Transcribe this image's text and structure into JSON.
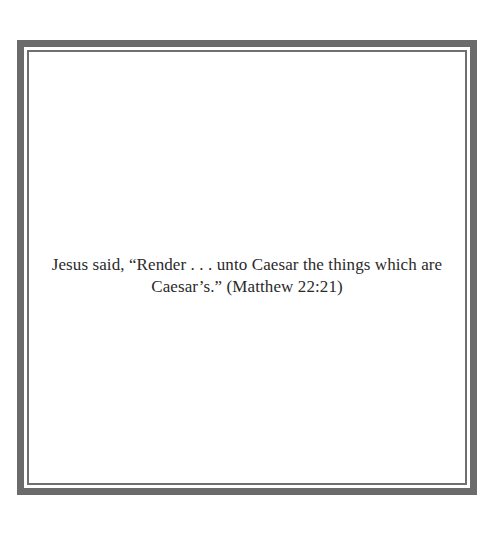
{
  "page": {
    "quote_lines": [
      "Jesus said, “Render . . . unto Caesar the things which are",
      "Caesar’s.” (Matthew 22:21)"
    ]
  },
  "colors": {
    "border": "#6b6b6b",
    "text": "#2a2a2a",
    "background": "#ffffff"
  }
}
